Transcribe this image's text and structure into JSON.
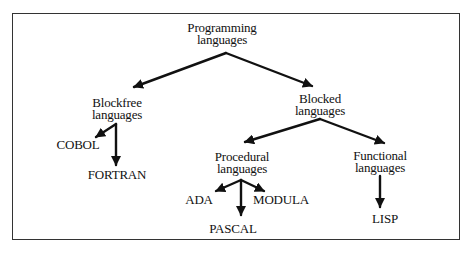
{
  "diagram": {
    "type": "tree",
    "colors": {
      "line": "#111111",
      "frame": "#333333",
      "background": "#ffffff"
    },
    "nodes": {
      "root": {
        "line1": "Programming",
        "line2": "languages"
      },
      "blockfree": {
        "line1": "Blockfree",
        "line2": "languages"
      },
      "blocked": {
        "line1": "Blocked",
        "line2": "languages"
      },
      "procedural": {
        "line1": "Procedural",
        "line2": "languages"
      },
      "functional": {
        "line1": "Functional",
        "line2": "languages"
      },
      "cobol": {
        "label": "COBOL"
      },
      "fortran": {
        "label": "FORTRAN"
      },
      "ada": {
        "label": "ADA"
      },
      "pascal": {
        "label": "PASCAL"
      },
      "modula": {
        "label": "MODULA"
      },
      "lisp": {
        "label": "LISP"
      }
    },
    "edges": [
      {
        "from": "Programming languages",
        "to": "Blockfree languages"
      },
      {
        "from": "Programming languages",
        "to": "Blocked languages"
      },
      {
        "from": "Blockfree languages",
        "to": "COBOL"
      },
      {
        "from": "Blockfree languages",
        "to": "FORTRAN"
      },
      {
        "from": "Blocked languages",
        "to": "Procedural languages"
      },
      {
        "from": "Blocked languages",
        "to": "Functional languages"
      },
      {
        "from": "Procedural languages",
        "to": "ADA"
      },
      {
        "from": "Procedural languages",
        "to": "PASCAL"
      },
      {
        "from": "Procedural languages",
        "to": "MODULA"
      },
      {
        "from": "Functional languages",
        "to": "LISP"
      }
    ]
  }
}
